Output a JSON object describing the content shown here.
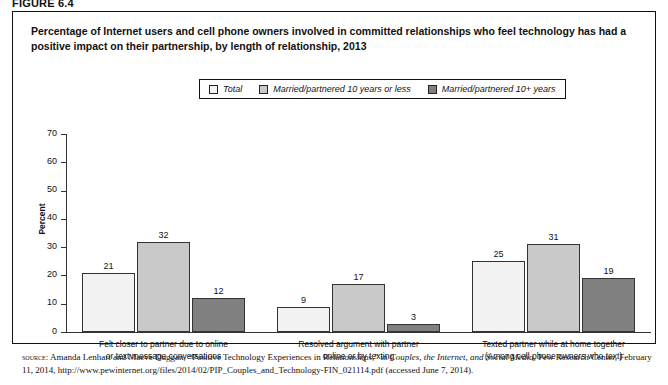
{
  "figure_label": "FIGURE 6.4",
  "chart_title": "Percentage of Internet users and cell phone owners involved in committed relationships who feel technology has had a positive impact on their partnership, by length of relationship, 2013",
  "legend": {
    "items": [
      {
        "label": "Total",
        "color": "#f2f2f2",
        "name": "legend-item-total"
      },
      {
        "label": "Married/partnered 10 years or less",
        "color": "#c9c9c9",
        "name": "legend-item-10-or-less"
      },
      {
        "label": "Married/partnered 10+ years",
        "color": "#808080",
        "name": "legend-item-10-plus"
      }
    ]
  },
  "source": {
    "label": "SOURCE:",
    "text_1": " Amanda Lenhart and Maeve Duggan, “Positive Technology Experiences in Relationships,” in ",
    "italic_1": "Couples, the Internet, and Social Media",
    "text_2": ", Pew Research Center, February 11, 2014, http://www.pewinternet.org/files/2014/02/PIP_Couples_and_Technology-FIN_021114.pdf (accessed June 7, 2014)."
  },
  "chart_data": {
    "type": "bar",
    "title": "Percentage of Internet users and cell phone owners involved in committed relationships who feel technology has had a positive impact on their partnership, by length of relationship, 2013",
    "xlabel": "",
    "ylabel": "Percent",
    "ylim": [
      0,
      70
    ],
    "yticks": [
      0,
      10,
      20,
      30,
      40,
      50,
      60,
      70
    ],
    "ytick_labels": [
      "0",
      "10",
      "20",
      "30",
      "40",
      "50",
      "60",
      "70"
    ],
    "grid": false,
    "legend_position": "top-center",
    "categories": [
      "Felt closer to partner due to online or text message conversations",
      "Resolved argument with partner online or by texting",
      "Texted partner while at home together (Among cell phone owners who text)"
    ],
    "category_lines": [
      [
        "Felt closer to partner due to online",
        "or text message conversations"
      ],
      [
        "Resolved argument with partner",
        "online or by texting"
      ],
      [
        "Texted partner while at home together",
        "(Among cell phone owners who text)"
      ]
    ],
    "series": [
      {
        "name": "Total",
        "color": "#f2f2f2",
        "values": [
          21,
          9,
          25
        ]
      },
      {
        "name": "Married/partnered 10 years or less",
        "color": "#c9c9c9",
        "values": [
          32,
          17,
          31
        ]
      },
      {
        "name": "Married/partnered 10+ years",
        "color": "#808080",
        "values": [
          12,
          3,
          19
        ]
      }
    ]
  }
}
